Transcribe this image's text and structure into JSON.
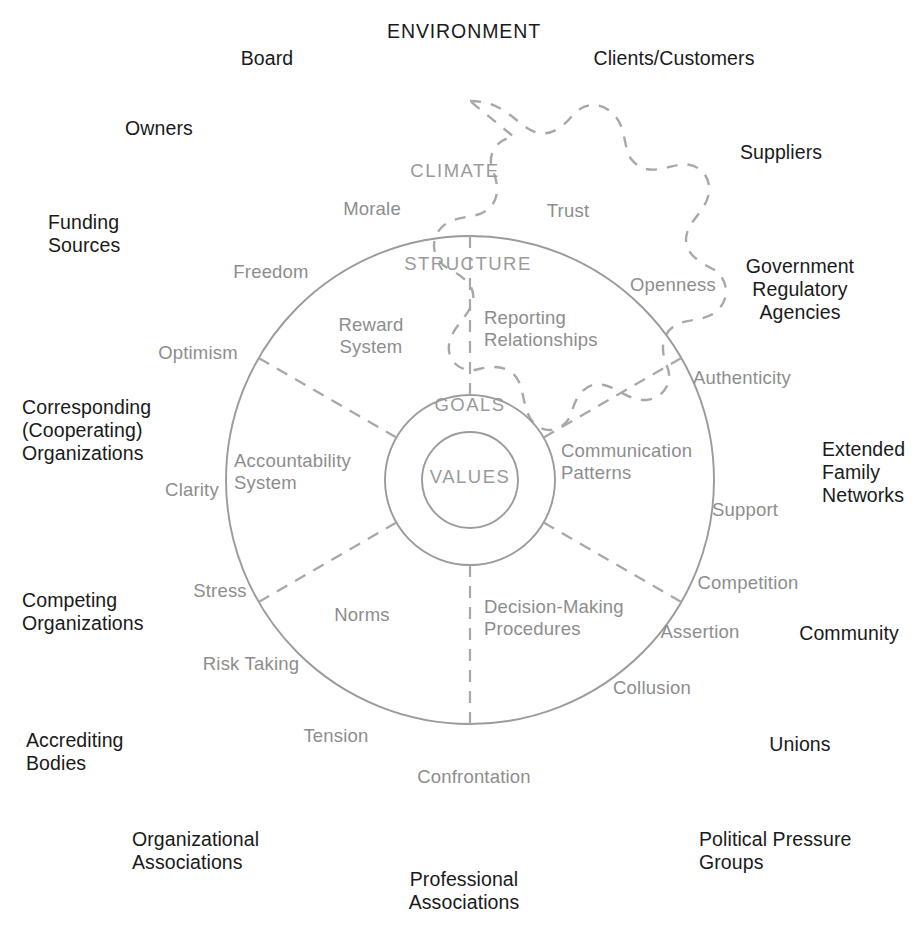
{
  "figure": {
    "environment_title": "ENVIRONMENT",
    "ring_titles": {
      "climate": "CLIMATE",
      "structure": "STRUCTURE",
      "goals": "GOALS",
      "values": "VALUES"
    },
    "colors": {
      "external_text": "#1a1a1a",
      "internal_text": "#8d8d8d",
      "ring_title_text": "#9a9a9a",
      "solid_line": "#9b9b9b",
      "dashed_line": "#a8a8a8",
      "background": "#ffffff"
    }
  },
  "environment_labels": [
    {
      "id": "board",
      "text": "Board",
      "x": 267,
      "y": 47,
      "align": "center"
    },
    {
      "id": "clients-customers",
      "text": "Clients/Customers",
      "x": 674,
      "y": 47,
      "align": "center"
    },
    {
      "id": "owners",
      "text": "Owners",
      "x": 159,
      "y": 117,
      "align": "center"
    },
    {
      "id": "suppliers",
      "text": "Suppliers",
      "x": 781,
      "y": 141,
      "align": "center"
    },
    {
      "id": "funding-sources",
      "text": "Funding\nSources",
      "x": 48,
      "y": 211,
      "align": "left"
    },
    {
      "id": "government-regulatory",
      "text": "Government\nRegulatory\nAgencies",
      "x": 800,
      "y": 255,
      "align": "center"
    },
    {
      "id": "corresponding-orgs",
      "text": "Corresponding\n(Cooperating)\nOrganizations",
      "x": 22,
      "y": 396,
      "align": "left"
    },
    {
      "id": "extended-family",
      "text": "Extended\nFamily\nNetworks",
      "x": 822,
      "y": 438,
      "align": "left"
    },
    {
      "id": "competing-orgs",
      "text": "Competing\nOrganizations",
      "x": 22,
      "y": 589,
      "align": "left"
    },
    {
      "id": "community",
      "text": "Community",
      "x": 849,
      "y": 622,
      "align": "center"
    },
    {
      "id": "accrediting-bodies",
      "text": "Accrediting\nBodies",
      "x": 26,
      "y": 729,
      "align": "left"
    },
    {
      "id": "unions",
      "text": "Unions",
      "x": 800,
      "y": 733,
      "align": "center"
    },
    {
      "id": "organizational-assoc",
      "text": "Organizational\nAssociations",
      "x": 132,
      "y": 828,
      "align": "left"
    },
    {
      "id": "political-pressure",
      "text": "Political Pressure\nGroups",
      "x": 699,
      "y": 828,
      "align": "left"
    },
    {
      "id": "professional-assoc",
      "text": "Professional\nAssociations",
      "x": 464,
      "y": 868,
      "align": "center"
    }
  ],
  "climate_labels": [
    {
      "id": "morale",
      "text": "Morale",
      "x": 372,
      "y": 198,
      "align": "center"
    },
    {
      "id": "trust",
      "text": "Trust",
      "x": 568,
      "y": 200,
      "align": "center"
    },
    {
      "id": "freedom",
      "text": "Freedom",
      "x": 271,
      "y": 261,
      "align": "center"
    },
    {
      "id": "openness",
      "text": "Openness",
      "x": 673,
      "y": 274,
      "align": "center"
    },
    {
      "id": "optimism",
      "text": "Optimism",
      "x": 198,
      "y": 342,
      "align": "center"
    },
    {
      "id": "authenticity",
      "text": "Authenticity",
      "x": 742,
      "y": 367,
      "align": "center"
    },
    {
      "id": "clarity",
      "text": "Clarity",
      "x": 192,
      "y": 479,
      "align": "center"
    },
    {
      "id": "support",
      "text": "Support",
      "x": 745,
      "y": 499,
      "align": "center"
    },
    {
      "id": "stress",
      "text": "Stress",
      "x": 220,
      "y": 580,
      "align": "center"
    },
    {
      "id": "competition",
      "text": "Competition",
      "x": 748,
      "y": 572,
      "align": "center"
    },
    {
      "id": "risk-taking",
      "text": "Risk Taking",
      "x": 251,
      "y": 653,
      "align": "center"
    },
    {
      "id": "assertion",
      "text": "Assertion",
      "x": 700,
      "y": 621,
      "align": "center"
    },
    {
      "id": "tension",
      "text": "Tension",
      "x": 336,
      "y": 725,
      "align": "center"
    },
    {
      "id": "collusion",
      "text": "Collusion",
      "x": 652,
      "y": 677,
      "align": "center"
    },
    {
      "id": "confrontation",
      "text": "Confrontation",
      "x": 474,
      "y": 766,
      "align": "center"
    }
  ],
  "structure_labels": [
    {
      "id": "reward-system",
      "text": "Reward\nSystem",
      "x": 371,
      "y": 314,
      "align": "center"
    },
    {
      "id": "reporting-relationships",
      "text": "Reporting\nRelationships",
      "x": 484,
      "y": 307,
      "align": "left"
    },
    {
      "id": "accountability-system",
      "text": "Accountability\nSystem",
      "x": 234,
      "y": 450,
      "align": "left"
    },
    {
      "id": "communication-patterns",
      "text": "Communication\nPatterns",
      "x": 561,
      "y": 440,
      "align": "left"
    },
    {
      "id": "norms",
      "text": "Norms",
      "x": 362,
      "y": 604,
      "align": "center"
    },
    {
      "id": "decision-making",
      "text": "Decision-Making\nProcedures",
      "x": 484,
      "y": 596,
      "align": "left"
    }
  ],
  "geometry": {
    "center_x": 470,
    "center_y": 480,
    "structure_radius": 244,
    "goals_radius": 85,
    "values_radius": 48,
    "environment_boundary": "dashed-scalloped-cloud"
  }
}
